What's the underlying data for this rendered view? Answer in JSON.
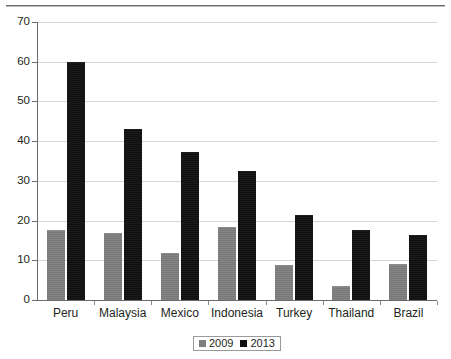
{
  "chart_data": {
    "type": "bar",
    "title": "",
    "subtitle": "",
    "xlabel": "",
    "ylabel": "",
    "ylim": [
      0,
      70
    ],
    "ytick_values": [
      0,
      10,
      20,
      30,
      40,
      50,
      60,
      70
    ],
    "ytick_labels": [
      "0",
      "10",
      "20",
      "30",
      "40",
      "50",
      "60",
      "70"
    ],
    "grid": "horizontal",
    "legend_position": "bottom-center",
    "categories": [
      "Peru",
      "Malaysia",
      "Mexico",
      "Indonesia",
      "Turkey",
      "Thailand",
      "Brazil"
    ],
    "series": [
      {
        "name": "2009",
        "color": "#7e7e7e",
        "values": [
          17.6,
          16.9,
          11.8,
          18.5,
          8.8,
          3.4,
          9.0
        ]
      },
      {
        "name": "2013",
        "color": "#111111",
        "values": [
          60.0,
          43.0,
          37.3,
          32.5,
          21.5,
          17.6,
          16.3
        ]
      }
    ]
  },
  "legend": {
    "items": [
      {
        "label": "2009",
        "swatch": "gray-square-icon"
      },
      {
        "label": "2013",
        "swatch": "black-square-icon"
      }
    ]
  }
}
